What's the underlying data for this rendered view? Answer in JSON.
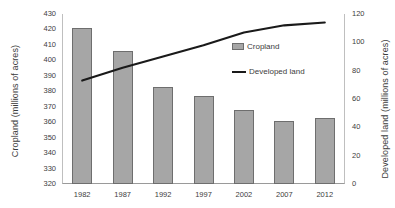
{
  "chart_data": {
    "type": "bar",
    "title": "",
    "xlabel": "",
    "categories": [
      "1982",
      "1987",
      "1992",
      "1997",
      "2002",
      "2007",
      "2012"
    ],
    "grid": false,
    "legend_position": "inside-upper-right",
    "series": [
      {
        "name": "Cropland",
        "type": "bar",
        "axis": "left",
        "color": "#a6a6a6",
        "values": [
          421,
          406,
          383,
          377,
          368,
          361,
          363
        ]
      },
      {
        "name": "Developed land",
        "type": "line",
        "axis": "right",
        "color": "#1a1a1a",
        "values": [
          73,
          82,
          90,
          98,
          107,
          112,
          114
        ]
      }
    ],
    "left_axis": {
      "label": "Cropland (millions of acres)",
      "ylim": [
        320,
        430
      ],
      "ticks": [
        320,
        330,
        340,
        350,
        360,
        370,
        380,
        390,
        400,
        410,
        420,
        430
      ],
      "tick_labels": [
        "320",
        "330",
        "340",
        "350",
        "360",
        "370",
        "380",
        "390",
        "400",
        "410",
        "420",
        "430"
      ]
    },
    "right_axis": {
      "label": "Developed land  (millions of acres)",
      "ylim": [
        0,
        120
      ],
      "ticks": [
        0,
        20,
        40,
        60,
        80,
        100,
        120
      ],
      "tick_labels": [
        "0",
        "20",
        "40",
        "60",
        "80",
        "100",
        "120"
      ]
    }
  },
  "legend": {
    "items": [
      {
        "label": "Cropland",
        "swatch": "bar-swatch"
      },
      {
        "label": "Developed  land",
        "swatch": "line-swatch"
      }
    ]
  }
}
